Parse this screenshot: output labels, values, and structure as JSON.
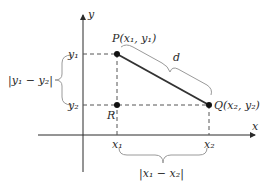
{
  "diagram": {
    "axes": {
      "x_label": "x",
      "y_label": "y"
    },
    "points": {
      "P": {
        "name": "P",
        "coord": "(x₁, y₁)"
      },
      "Q": {
        "name": "Q",
        "coord": "(x₂, y₂)"
      },
      "R": {
        "name": "R"
      }
    },
    "ticks": {
      "x1": "x₁",
      "x2": "x₂",
      "y1": "y₁",
      "y2": "y₂"
    },
    "braces": {
      "distance": "d",
      "vertical": "|y₁ − y₂|",
      "horizontal": "|x₁ − x₂|"
    },
    "colors": {
      "ink": "#2a2a2a",
      "segment": "#333333",
      "brace": "#9a9a9a",
      "dashed": "#555555"
    }
  }
}
